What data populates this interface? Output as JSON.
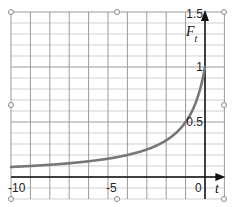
{
  "chart_data": {
    "type": "line",
    "title": "",
    "xlabel": "t",
    "ylabel": "F_t",
    "xlim": [
      -10,
      1
    ],
    "ylim": [
      -0.2,
      1.5
    ],
    "x_ticks": [
      {
        "value": -10,
        "label": "-10"
      },
      {
        "value": -5,
        "label": "-5"
      },
      {
        "value": 0,
        "label": "0"
      }
    ],
    "y_ticks": [
      {
        "value": 0.5,
        "label": "0.5"
      },
      {
        "value": 1,
        "label": "1"
      },
      {
        "value": 1.5,
        "label": "1.5"
      }
    ],
    "grid": {
      "x_step": 1,
      "y_step": 0.1
    },
    "series": [
      {
        "name": "F_t",
        "formula": "1/(1-t)",
        "color": "#777777",
        "x": [
          -10,
          -9,
          -8,
          -7,
          -6,
          -5,
          -4,
          -3,
          -2,
          -1.5,
          -1,
          -0.5,
          -0.25,
          0
        ],
        "y": [
          0.091,
          0.1,
          0.111,
          0.125,
          0.143,
          0.167,
          0.2,
          0.25,
          0.333,
          0.4,
          0.5,
          0.667,
          0.8,
          1.0
        ]
      }
    ],
    "handles": 8
  },
  "labels": {
    "x_axis": "t",
    "y_axis_main": "F",
    "y_axis_sub": "t"
  },
  "colors": {
    "curve": "#777777",
    "axis": "#111111",
    "grid_major": "#9a9a9a",
    "grid_minor": "#cfcfcf"
  }
}
